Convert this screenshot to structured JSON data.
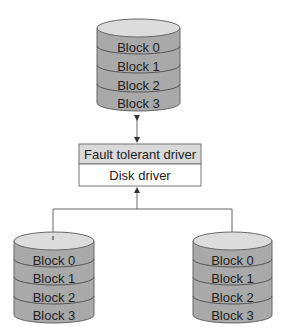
{
  "colors": {
    "disk_top": "#dcdcdc",
    "disk_body": "#a9a9a9",
    "disk_line": "#555555",
    "ft_driver_fill": "#d9d9d9",
    "disk_driver_fill": "#ffffff",
    "stroke": "#666666"
  },
  "top_disk": {
    "blocks": [
      "Block 0",
      "Block 1",
      "Block 2",
      "Block 3"
    ]
  },
  "drivers": {
    "fault_tolerant": "Fault tolerant driver",
    "disk": "Disk driver"
  },
  "left_disk": {
    "blocks": [
      "Block 0",
      "Block 1",
      "Block 2",
      "Block 3"
    ]
  },
  "right_disk": {
    "blocks": [
      "Block 0",
      "Block 1",
      "Block 2",
      "Block 3"
    ]
  }
}
